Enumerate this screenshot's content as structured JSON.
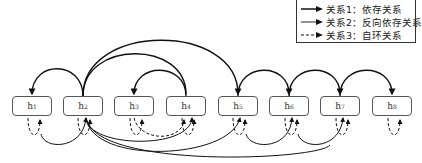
{
  "legend": {
    "items": [
      {
        "label": "关系1：依存关系",
        "style": "solid-thick"
      },
      {
        "label": "关系2：反向依存关系",
        "style": "solid-thin"
      },
      {
        "label": "关系3：自环关系",
        "style": "dashed"
      }
    ]
  },
  "nodes": [
    {
      "base": "h",
      "sub": "1"
    },
    {
      "base": "h",
      "sub": "2"
    },
    {
      "base": "h",
      "sub": "3"
    },
    {
      "base": "h",
      "sub": "4"
    },
    {
      "base": "h",
      "sub": "5"
    },
    {
      "base": "h",
      "sub": "6"
    },
    {
      "base": "h",
      "sub": "7"
    },
    {
      "base": "h",
      "sub": "8"
    }
  ],
  "colors": {
    "line": "#111111",
    "box_border": "#555555"
  }
}
